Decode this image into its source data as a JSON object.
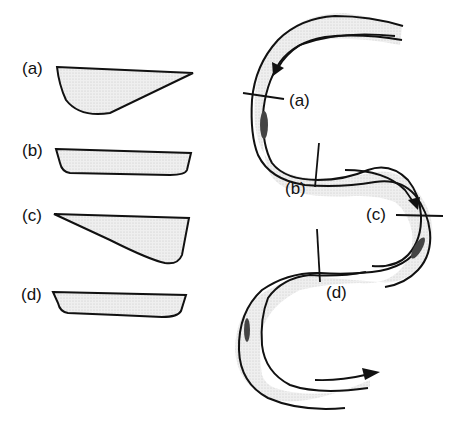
{
  "figure": {
    "cross_sections": [
      {
        "id": "a",
        "label": "(a)",
        "shape": "asymmetric, deep on left (outer bend)"
      },
      {
        "id": "b",
        "label": "(b)",
        "shape": "symmetric, shallow"
      },
      {
        "id": "c",
        "label": "(c)",
        "shape": "asymmetric, deep on right (outer bend)"
      },
      {
        "id": "d",
        "label": "(d)",
        "shape": "symmetric, shallow"
      }
    ],
    "river_labels": {
      "a": "(a)",
      "b": "(b)",
      "c": "(c)",
      "d": "(d)"
    },
    "colors": {
      "line": "#111111",
      "fill": "#ebebeb",
      "deep": "#555555"
    }
  }
}
